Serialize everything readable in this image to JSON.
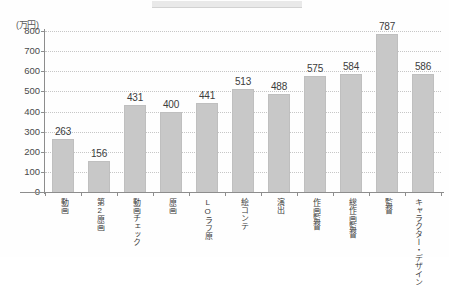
{
  "chart_data": {
    "type": "bar",
    "title": "",
    "subtitle": "",
    "xlabel": "",
    "ylabel": "",
    "unit_label": "(万円)",
    "ylim": [
      0,
      800
    ],
    "ytick_step": 100,
    "yticks": [
      "0",
      "100",
      "200",
      "300",
      "400",
      "500",
      "600",
      "700",
      "800"
    ],
    "grid": true,
    "legend": "none",
    "bar_color": "#c8c8c8",
    "categories": [
      "動画",
      "第2原画",
      "動画チェック",
      "原画",
      "LOラフ原",
      "絵コンテ",
      "演出",
      "作画監督",
      "総作画監督",
      "監督",
      "キャラクター・デザイン"
    ],
    "category_columns": [
      [
        "動画"
      ],
      [
        "第2原画"
      ],
      [
        "動画チェック"
      ],
      [
        "原画"
      ],
      [
        "LOラフ原"
      ],
      [
        "絵コンテ"
      ],
      [
        "演出"
      ],
      [
        "作画監督"
      ],
      [
        "総作画監督"
      ],
      [
        "監督"
      ],
      [
        "キャラクター・",
        "デザイン"
      ]
    ],
    "values": [
      263,
      156,
      431,
      400,
      441,
      513,
      488,
      575,
      584,
      787,
      586
    ],
    "value_labels": [
      "263",
      "156",
      "431",
      "400",
      "441",
      "513",
      "488",
      "575",
      "584",
      "787",
      "586"
    ]
  }
}
